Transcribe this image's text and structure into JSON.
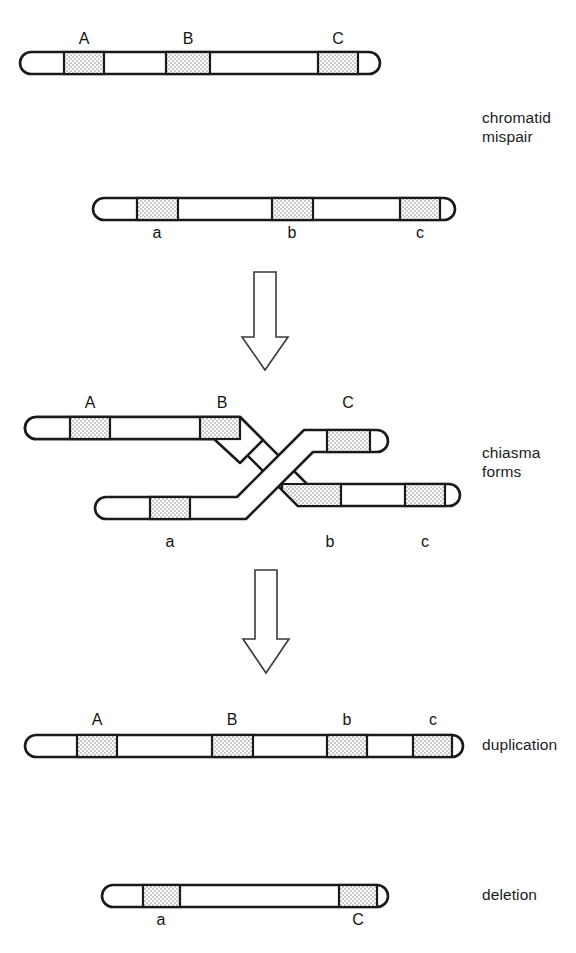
{
  "figure": {
    "background_color": "#ffffff",
    "line_color": "#1a1a1a",
    "band_fill_color": "#d9d9d9",
    "band_pattern": "stipple-checker"
  },
  "stage_labels": [
    {
      "id": "chromatid-mispair",
      "text": "chromatid\nmispair",
      "x": 482,
      "y": 108
    },
    {
      "id": "chiasma-forms",
      "text": "chiasma\nforms",
      "x": 482,
      "y": 443
    },
    {
      "id": "duplication",
      "text": "duplication",
      "x": 482,
      "y": 718
    },
    {
      "id": "deletion",
      "text": "deletion",
      "x": 482,
      "y": 884
    }
  ],
  "arrows": [
    {
      "id": "arrow-mispair-to-chiasma",
      "direction": "down",
      "cx": 265,
      "top": 272,
      "bottom": 368
    },
    {
      "id": "arrow-chiasma-to-products",
      "direction": "down",
      "cx": 266,
      "top": 570,
      "bottom": 672
    }
  ],
  "chromosomes": [
    {
      "id": "upper-parental-chromatid",
      "stage": "chromatid mispair",
      "x1": 20,
      "x2": 380,
      "cy": 63,
      "height": 22,
      "bands": [
        {
          "label": "A",
          "x1": 64,
          "x2": 104,
          "label_x": 84,
          "label_y": 30
        },
        {
          "label": "B",
          "x1": 166,
          "x2": 210,
          "label_x": 188,
          "label_y": 30
        },
        {
          "label": "C",
          "x1": 318,
          "x2": 358,
          "label_x": 338,
          "label_y": 30
        }
      ]
    },
    {
      "id": "lower-parental-chromatid",
      "stage": "chromatid mispair",
      "x1": 93,
      "x2": 455,
      "cy": 209,
      "height": 22,
      "bands": [
        {
          "label": "a",
          "x1": 137,
          "x2": 178,
          "label_x": 157,
          "label_y": 224
        },
        {
          "label": "b",
          "x1": 272,
          "x2": 313,
          "label_x": 292,
          "label_y": 224
        },
        {
          "label": "c",
          "x1": 400,
          "x2": 440,
          "label_x": 420,
          "label_y": 224
        }
      ]
    },
    {
      "id": "duplication-product",
      "stage": "duplication",
      "x1": 25,
      "x2": 420,
      "cy": 746,
      "height": 22,
      "bands": [
        {
          "label": "A",
          "x1": 77,
          "x2": 117,
          "label_x": 97,
          "label_y": 713
        },
        {
          "label": "B",
          "x1": 212,
          "x2": 253,
          "label_x": 232,
          "label_y": 713
        },
        {
          "label": "b",
          "x1": 327,
          "x2": 367,
          "label_x": 347,
          "label_y": 713
        },
        {
          "label": "c",
          "x1": 413,
          "x2": 452,
          "label_x": 433,
          "label_y": 713
        }
      ]
    },
    {
      "id": "deletion-product",
      "stage": "deletion",
      "x1": 102,
      "x2": 390,
      "cy": 896,
      "height": 22,
      "bands": [
        {
          "label": "a",
          "x1": 143,
          "x2": 180,
          "label_x": 161,
          "label_y": 925
        },
        {
          "label": "C",
          "x1": 339,
          "x2": 377,
          "label_x": 358,
          "label_y": 925
        }
      ]
    }
  ],
  "chiasma": {
    "stage": "chiasma forms",
    "upper_left_arm": {
      "id": "chiasma-upper-left-arm",
      "x1": 25,
      "bend_x": 240,
      "cy": 428,
      "bands": [
        {
          "label": "A",
          "x1": 70,
          "x2": 110,
          "label_x": 90,
          "label_y": 396
        },
        {
          "label": "B",
          "x1": 200,
          "x2": 240,
          "label_x": 222,
          "label_y": 396
        }
      ]
    },
    "lower_left_arm": {
      "id": "chiasma-lower-left-arm",
      "x1": 95,
      "bend_x": 237,
      "cy": 508,
      "bands": [
        {
          "label": "a",
          "x1": 150,
          "x2": 190,
          "label_x": 170,
          "label_y": 535
        }
      ]
    },
    "upper_right_arm": {
      "id": "chiasma-upper-right-arm",
      "bend_x": 322,
      "x2": 388,
      "cy": 428,
      "bands": [
        {
          "label": "C",
          "x1": 327,
          "x2": 370,
          "label_x": 348,
          "label_y": 396
        }
      ]
    },
    "lower_right_arm": {
      "id": "chiasma-lower-right-arm",
      "bend_x": 305,
      "x2": 460,
      "cy": 508,
      "bands": [
        {
          "label": "b",
          "x1": 303,
          "x2": 341,
          "label_x": 330,
          "label_y": 535
        },
        {
          "label": "c",
          "x1": 405,
          "x2": 445,
          "label_x": 425,
          "label_y": 535
        }
      ]
    }
  }
}
